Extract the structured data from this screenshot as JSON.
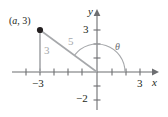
{
  "figure": {
    "type": "coordinate-plane-right-triangle"
  },
  "axes": {
    "x_name": "x",
    "y_name": "y",
    "x_ticks": [
      {
        "value": -3,
        "label": "−3"
      },
      {
        "value": 3,
        "label": "3"
      }
    ],
    "y_ticks": [
      {
        "value": 3,
        "label": "3"
      },
      {
        "value": -2,
        "label": "−2"
      }
    ],
    "xlim": [
      -6,
      4.2
    ],
    "ylim": [
      -3,
      4
    ]
  },
  "annotations": {
    "point_label": "(a, 3)",
    "point_label_a": "a",
    "point_label_rest": ", 3)",
    "point_label_open": "(",
    "leg_label": "3",
    "hypotenuse_label": "5",
    "angle_label": "θ"
  },
  "geometry": {
    "point": {
      "x": -4,
      "y": 3
    },
    "origin": {
      "x": 0,
      "y": 0
    },
    "foot": {
      "x": -4,
      "y": 0
    },
    "hypotenuse_length": 5,
    "vertical_leg_length": 3,
    "angle_from_positive_x_axis_degrees": 143
  },
  "colors": {
    "axis": "#6d6e71",
    "triangle": "#a6a8ab",
    "point": "#231f20",
    "text": "#231f20",
    "side_text": "#a6a8ab",
    "arc": "#a6a8ab"
  }
}
